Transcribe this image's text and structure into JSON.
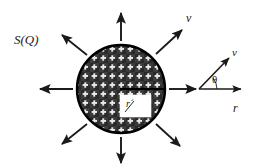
{
  "figure": {
    "background_color": "#ffffff",
    "ink_color": "#1a1a1a",
    "width": 253,
    "height": 168
  },
  "labels": {
    "structure_factor": "S(Q)",
    "velocity_outer": "v",
    "velocity_vector": "v",
    "angle": "θ",
    "radial_axis": "r",
    "inner_radius": "r´"
  },
  "sphere": {
    "center_x": 121,
    "center_y": 89,
    "radius": 44,
    "fill_color": "#3a3a3a",
    "edge_color": "#000000",
    "hatch_pattern": "white-plus-grid",
    "hatch_color": "#e8e8e8",
    "inner_box": {
      "x": 120,
      "y": 95,
      "width": 30,
      "height": 22,
      "fill_color": "#ffffff",
      "label": "r´"
    },
    "center_line": {
      "from_x": 121,
      "from_y": 89,
      "to_x": 165,
      "to_y": 89
    }
  },
  "radial_arrows": [
    {
      "name": "arrow-north",
      "angle_deg": 90,
      "tail_r": 48,
      "head_r": 85
    },
    {
      "name": "arrow-northeast",
      "angle_deg": 45,
      "tail_r": 48,
      "head_r": 83
    },
    {
      "name": "arrow-east",
      "angle_deg": 0,
      "tail_r": 48,
      "head_r": 82
    },
    {
      "name": "arrow-southeast",
      "angle_deg": -45,
      "tail_r": 48,
      "head_r": 83
    },
    {
      "name": "arrow-south",
      "angle_deg": -90,
      "tail_r": 48,
      "head_r": 85
    },
    {
      "name": "arrow-southwest",
      "angle_deg": 225,
      "tail_r": 48,
      "head_r": 83
    },
    {
      "name": "arrow-west",
      "angle_deg": 180,
      "tail_r": 48,
      "head_r": 82
    },
    {
      "name": "arrow-northwest",
      "angle_deg": 135,
      "tail_r": 48,
      "head_r": 83
    }
  ],
  "angle_diagram": {
    "origin_x": 199,
    "origin_y": 89,
    "r_axis": {
      "to_x": 243,
      "to_y": 89,
      "label": "r"
    },
    "v_axis": {
      "to_x": 231,
      "to_y": 56,
      "label": "v",
      "angle_deg": 37
    },
    "arc": {
      "radius": 18,
      "label": "θ"
    }
  }
}
